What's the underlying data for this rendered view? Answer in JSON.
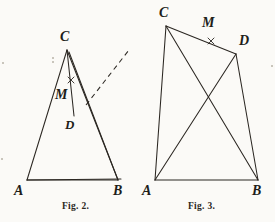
{
  "page": {
    "background_color": "#fbfaf7",
    "ink_color": "#2b2722",
    "width": 275,
    "height": 222
  },
  "figures": [
    {
      "id": "fig-2",
      "caption": "Fig. 2.",
      "caption_pos": {
        "x": 62,
        "y": 200
      },
      "type": "triangle-with-interior-point",
      "vertices": [
        {
          "name": "A",
          "label": "A",
          "x": 27,
          "y": 180,
          "label_x": 15,
          "label_y": 184
        },
        {
          "name": "B",
          "label": "B",
          "x": 118,
          "y": 180,
          "label_x": 114,
          "label_y": 184
        },
        {
          "name": "C",
          "label": "C",
          "x": 67,
          "y": 50,
          "label_x": 60,
          "label_y": 30
        },
        {
          "name": "D",
          "label": "D",
          "x": 74,
          "y": 116,
          "label_x": 66,
          "label_y": 119
        },
        {
          "name": "M",
          "label": "M",
          "x": 70,
          "y": 86,
          "label_x": 56,
          "label_y": 90
        }
      ],
      "segments": [
        {
          "from": "A",
          "to": "B",
          "style": "solid"
        },
        {
          "from": "A",
          "to": "C",
          "style": "solid"
        },
        {
          "from": "B",
          "to": "C",
          "style": "solid"
        },
        {
          "from": "C",
          "to": "D",
          "style": "solid"
        },
        {
          "from": "A",
          "to": "D",
          "style": "solid",
          "extended_to": {
            "x": 121,
            "y": 179
          }
        },
        {
          "from": "B",
          "to": "D",
          "style": "solid",
          "extended_to": {
            "x": 69,
            "y": 52
          }
        }
      ],
      "dashed_ray": {
        "x1": 86,
        "y1": 105,
        "x2": 129,
        "y2": 50
      },
      "cross_marks": [
        {
          "on_segment": "C-D",
          "x": 71,
          "y": 80,
          "size": 4
        }
      ]
    },
    {
      "id": "fig-3",
      "caption": "Fig. 3.",
      "caption_pos": {
        "x": 188,
        "y": 200
      },
      "type": "quadrilateral-with-diagonals",
      "vertices": [
        {
          "name": "A",
          "label": "A",
          "x": 155,
          "y": 180,
          "label_x": 143,
          "label_y": 184
        },
        {
          "name": "B",
          "label": "B",
          "x": 258,
          "y": 180,
          "label_x": 253,
          "label_y": 184
        },
        {
          "name": "C",
          "label": "C",
          "x": 166,
          "y": 26,
          "label_x": 160,
          "label_y": 8
        },
        {
          "name": "D",
          "label": "D",
          "x": 236,
          "y": 54,
          "label_x": 238,
          "label_y": 36
        },
        {
          "name": "M",
          "label": "M",
          "x": 210,
          "y": 40,
          "label_x": 203,
          "label_y": 17
        }
      ],
      "segments": [
        {
          "from": "A",
          "to": "B",
          "style": "solid"
        },
        {
          "from": "A",
          "to": "C",
          "style": "solid"
        },
        {
          "from": "A",
          "to": "D",
          "style": "solid"
        },
        {
          "from": "C",
          "to": "B",
          "style": "solid"
        },
        {
          "from": "C",
          "to": "D",
          "style": "solid"
        },
        {
          "from": "D",
          "to": "B",
          "style": "solid"
        }
      ],
      "dashed_ray": null,
      "cross_marks": [
        {
          "on_segment": "C-D",
          "x": 211,
          "y": 41,
          "size": 4
        }
      ]
    }
  ],
  "specks": [
    {
      "x": 2,
      "y": 62,
      "d": 2
    },
    {
      "x": 1,
      "y": 158,
      "d": 2
    },
    {
      "x": 52,
      "y": 57,
      "d": 2
    },
    {
      "x": 52,
      "y": 61,
      "d": 2
    },
    {
      "x": 271,
      "y": 65,
      "d": 2
    }
  ]
}
